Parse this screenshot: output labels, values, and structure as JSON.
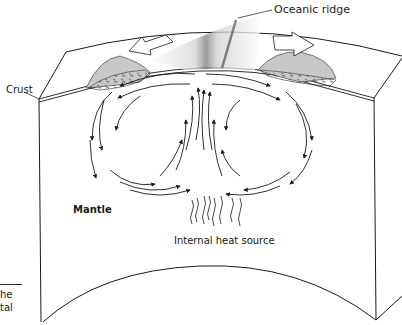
{
  "diagram": {
    "labels": {
      "oceanic_ridge": "Oceanic ridge",
      "crust": "Crust",
      "mantle": "Mantle",
      "heat_source": "Internal heat source"
    },
    "caption_fragments": {
      "line1": "he",
      "line2": "tal"
    },
    "elements": {
      "plate_motion_arrows": [
        "left",
        "right"
      ],
      "convection_cells": 2,
      "rising_heat_lines": 8
    },
    "colors": {
      "line": "#1a1a1a",
      "background": "#ffffff",
      "shading": "#b0b0b0"
    }
  }
}
